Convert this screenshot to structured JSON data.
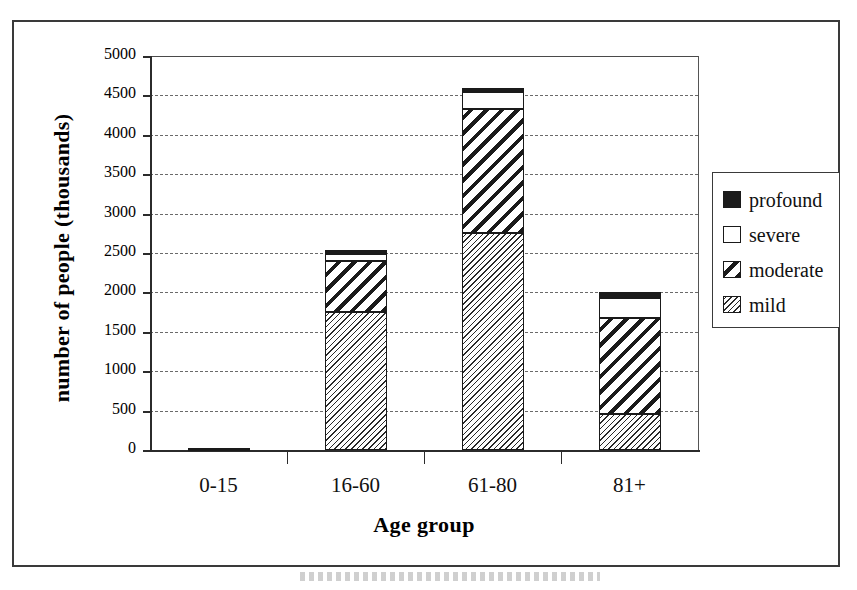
{
  "figure": {
    "caption_fragment": ""
  },
  "legend": {
    "position": "right",
    "items": [
      {
        "label": "profound",
        "swatch": "solid-black-swatch"
      },
      {
        "label": "severe",
        "swatch": "empty-white-swatch"
      },
      {
        "label": "moderate",
        "swatch": "wide-diagonal-hatch-swatch"
      },
      {
        "label": "mild",
        "swatch": "fine-diagonal-hatch-swatch"
      }
    ]
  },
  "chart_data": {
    "type": "bar",
    "subtype": "stacked",
    "title": "",
    "xlabel": "Age group",
    "ylabel": "number of people (thousands)",
    "categories": [
      "0-15",
      "16-60",
      "61-80",
      "81+"
    ],
    "ylim": [
      0,
      5000
    ],
    "yticks": [
      0,
      500,
      1000,
      1500,
      2000,
      2500,
      3000,
      3500,
      4000,
      4500,
      5000
    ],
    "ytick_labels": [
      "0",
      "500",
      "1000",
      "1500",
      "2000",
      "2500",
      "3000",
      "3500",
      "4000",
      "4500",
      "5000"
    ],
    "grid": true,
    "grid_axis": "y",
    "series": [
      {
        "name": "mild",
        "values": [
          15,
          1750,
          2750,
          460
        ]
      },
      {
        "name": "moderate",
        "values": [
          8,
          650,
          1580,
          1210
        ]
      },
      {
        "name": "severe",
        "values": [
          2,
          90,
          210,
          260
        ]
      },
      {
        "name": "profound",
        "values": [
          2,
          50,
          60,
          75
        ]
      }
    ],
    "totals": [
      27,
      2540,
      4600,
      2005
    ],
    "units": "thousands"
  }
}
